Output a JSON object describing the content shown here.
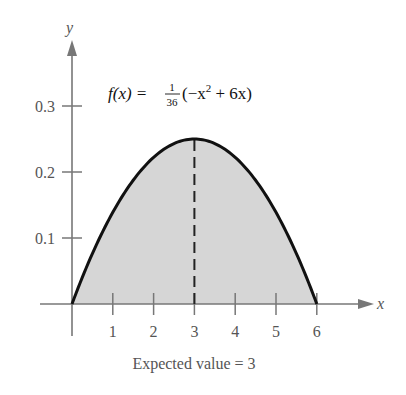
{
  "chart_data": {
    "type": "area",
    "title": "",
    "function_label": "f(x) = 1/36(−x² + 6x)",
    "formula_parts": {
      "lhs": "f(x) = ",
      "frac_num": "1",
      "frac_den": "36",
      "rhs_open": "(−x",
      "rhs_exp": "2",
      "rhs_close": " + 6x)"
    },
    "xlabel": "x",
    "ylabel": "y",
    "x_ticks": [
      "1",
      "2",
      "3",
      "4",
      "5",
      "6"
    ],
    "y_ticks": [
      "0.1",
      "0.2",
      "0.3"
    ],
    "xlim": [
      0,
      6
    ],
    "ylim": [
      0,
      0.3
    ],
    "x": [
      0,
      0.5,
      1,
      1.5,
      2,
      2.5,
      3,
      3.5,
      4,
      4.5,
      5,
      5.5,
      6
    ],
    "values": [
      0,
      0.0764,
      0.1389,
      0.1875,
      0.2222,
      0.2431,
      0.25,
      0.2431,
      0.2222,
      0.1875,
      0.1389,
      0.0764,
      0
    ],
    "shaded_region": "area under f(x) from x=0 to x=6",
    "annotations": [
      {
        "type": "dashed-vertical-line",
        "x": 3,
        "from_y": 0,
        "to_y": 0.25
      }
    ],
    "caption": "Expected value = 3",
    "grid": false,
    "colors": {
      "curve": "#111111",
      "fill": "#d4d4d4",
      "axis": "#777777"
    }
  }
}
